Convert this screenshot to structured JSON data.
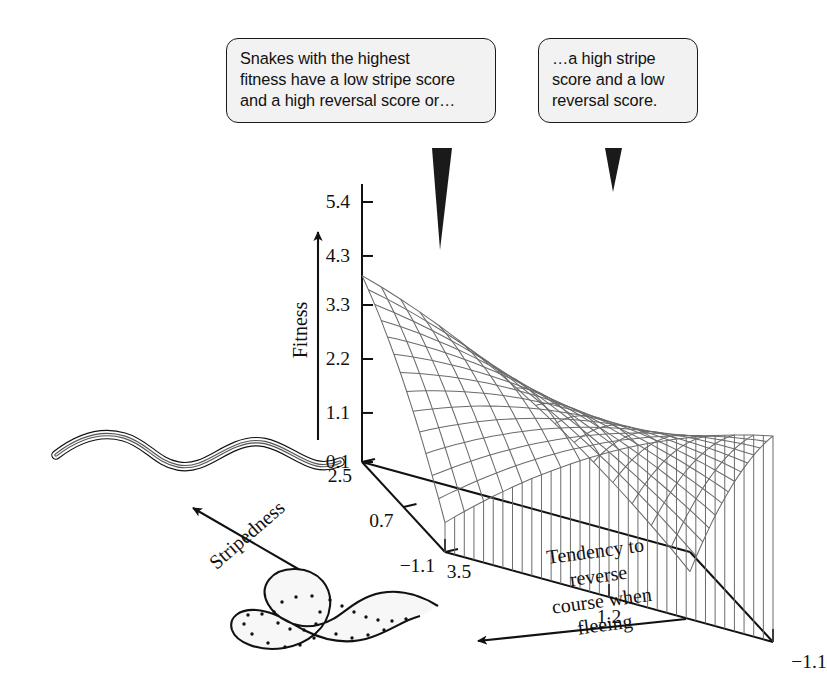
{
  "figure": {
    "kind": "3d-wireframe-surface-plot",
    "background": "#ffffff",
    "ink": "#111111",
    "mesh_color": "#6b6b6b",
    "callout_fill": "#f2f2f2",
    "callout_border": "#1a1a1a"
  },
  "callouts": [
    {
      "id": "callout-low-stripe-high-reversal",
      "text": "Snakes with the highest\nfitness have a low stripe score\nand a high reversal score or…",
      "points_to": "left-peak-of-surface"
    },
    {
      "id": "callout-high-stripe-low-reversal",
      "text": "…a high stripe\nscore and a low\nreversal score.",
      "points_to": "right-peak-of-surface"
    }
  ],
  "axes": {
    "z": {
      "title": "Fitness",
      "ticks": [
        "5.4",
        "4.3",
        "3.3",
        "2.2",
        "1.1",
        "0.1"
      ],
      "tick_values": [
        5.4,
        4.3,
        3.3,
        2.2,
        1.1,
        0.1
      ],
      "arrow": "up"
    },
    "y": {
      "title": "Stripedness",
      "ticks": [
        "2.5",
        "0.7",
        "−1.1"
      ],
      "tick_values": [
        2.5,
        0.7,
        -1.1
      ],
      "arrow": "up-left"
    },
    "x": {
      "title": "Tendency to reverse\ncourse when fleeing",
      "ticks": [
        "3.5",
        "1.2",
        "−1.1"
      ],
      "tick_values": [
        3.5,
        1.2,
        -1.1
      ],
      "arrow": "left"
    }
  },
  "snakes": [
    {
      "id": "striped-snake",
      "pattern": "longitudinal-stripes",
      "pose": "wavy-crawling",
      "near_axis": "Stripedness"
    },
    {
      "id": "spotted-snake",
      "pattern": "spotted-blotched",
      "pose": "curled-reversing",
      "near_axis": "Tendency to reverse course when fleeing"
    }
  ],
  "chart_data": {
    "type": "surface",
    "title": "",
    "xlabel": "Tendency to reverse course when fleeing",
    "ylabel": "Stripedness",
    "zlabel": "Fitness",
    "xlim": [
      -1.1,
      3.5
    ],
    "ylim": [
      -1.1,
      2.5
    ],
    "zlim": [
      0.1,
      5.4
    ],
    "xticks": [
      3.5,
      1.2,
      -1.1
    ],
    "yticks": [
      2.5,
      0.7,
      -1.1
    ],
    "zticks": [
      0.1,
      1.1,
      2.2,
      3.3,
      4.3,
      5.4
    ],
    "grid": false,
    "legend": null,
    "shape": "saddle",
    "model": {
      "form": "z = c0 + cx*xn + cy*yn + cxy*xn*yn + cxx*xn^2 + cyy*yn^2",
      "normalized_domain": [
        -1,
        1
      ],
      "c0": 3.05,
      "cx": -0.15,
      "cy": 0.35,
      "cxy": 1.95,
      "cxx": -0.55,
      "cyy": -0.35
    },
    "surface_grid": {
      "nx": 17,
      "ny": 13
    },
    "corner_values": {
      "high_reversal_low_stripe": 4.3,
      "low_reversal_high_stripe": 5.4,
      "high_reversal_high_stripe": 1.3,
      "low_reversal_low_stripe": 2.2
    }
  }
}
